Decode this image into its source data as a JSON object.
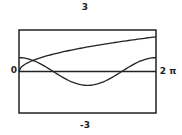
{
  "chart_data": {
    "type": "line",
    "title": "",
    "xlabel": "",
    "ylabel": "",
    "xlim": [
      0,
      6.2832
    ],
    "ylim": [
      -3,
      3
    ],
    "x_tick_labels": {
      "min": "0",
      "max": "2 π"
    },
    "y_tick_labels": {
      "max": "3",
      "min": "-3"
    },
    "grid": false,
    "legend": "none",
    "series": [
      {
        "name": "sqrt(x)",
        "function": "sqrt",
        "color": "#222222"
      },
      {
        "name": "cos(x)",
        "function": "cos",
        "color": "#222222"
      }
    ],
    "samples": 60
  },
  "colors": {
    "frame": "#222222",
    "axis": "#222222",
    "background": "#ffffff"
  }
}
